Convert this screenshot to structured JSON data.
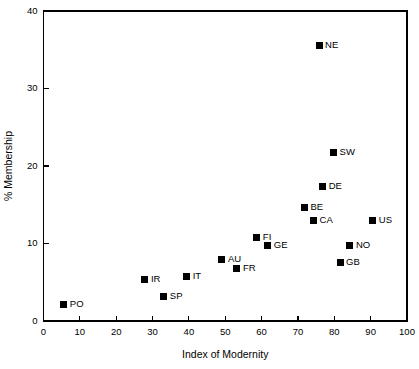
{
  "chart_data": {
    "type": "scatter",
    "title": "",
    "xlabel": "Index of Modernity",
    "ylabel": "% Membership",
    "xlim": [
      0,
      100
    ],
    "ylim": [
      0,
      40
    ],
    "xticks": [
      0,
      10,
      20,
      30,
      40,
      50,
      60,
      70,
      80,
      90,
      100
    ],
    "yticks": [
      0,
      10,
      20,
      30,
      40
    ],
    "xtick_labels": [
      "0",
      "10",
      "20",
      "30",
      "40",
      "50",
      "60",
      "70",
      "80",
      "90",
      "100"
    ],
    "ytick_labels": [
      "0",
      "10",
      "20",
      "30",
      "40"
    ],
    "grid": false,
    "legend": false,
    "marker": "square",
    "marker_color": "#000000",
    "points": [
      {
        "label": "PO",
        "x": 5.6,
        "y": 2.1,
        "label_dx": 6,
        "label_dy": 0
      },
      {
        "label": "SP",
        "x": 33.1,
        "y": 3.1,
        "label_dx": 6,
        "label_dy": 0
      },
      {
        "label": "IR",
        "x": 27.9,
        "y": 5.3,
        "label_dx": 6,
        "label_dy": 0
      },
      {
        "label": "IT",
        "x": 39.4,
        "y": 5.7,
        "label_dx": 6,
        "label_dy": 0
      },
      {
        "label": "FR",
        "x": 53.2,
        "y": 6.8,
        "label_dx": 6,
        "label_dy": 0
      },
      {
        "label": "GB",
        "x": 81.6,
        "y": 7.5,
        "label_dx": 6,
        "label_dy": 0
      },
      {
        "label": "AU",
        "x": 49.1,
        "y": 8.0,
        "label_dx": 6,
        "label_dy": 0
      },
      {
        "label": "GE",
        "x": 61.7,
        "y": 9.7,
        "label_dx": 6,
        "label_dy": 0
      },
      {
        "label": "NO",
        "x": 84.3,
        "y": 9.8,
        "label_dx": 6,
        "label_dy": 0
      },
      {
        "label": "FI",
        "x": 58.7,
        "y": 10.8,
        "label_dx": 6,
        "label_dy": 0
      },
      {
        "label": "CA",
        "x": 74.3,
        "y": 13.0,
        "label_dx": 6,
        "label_dy": 0
      },
      {
        "label": "US",
        "x": 90.6,
        "y": 13.0,
        "label_dx": 6,
        "label_dy": 0
      },
      {
        "label": "BE",
        "x": 71.8,
        "y": 14.6,
        "label_dx": 6,
        "label_dy": 0
      },
      {
        "label": "DE",
        "x": 76.8,
        "y": 17.3,
        "label_dx": 6,
        "label_dy": 0
      },
      {
        "label": "SW",
        "x": 79.8,
        "y": 21.7,
        "label_dx": 6,
        "label_dy": 0
      },
      {
        "label": "NE",
        "x": 75.8,
        "y": 35.5,
        "label_dx": 6,
        "label_dy": 0
      }
    ]
  }
}
